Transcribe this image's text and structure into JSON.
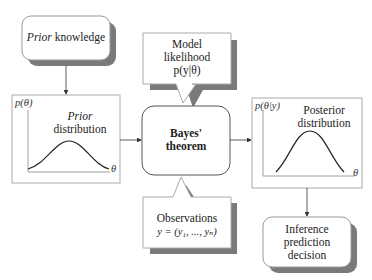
{
  "prior_knowledge": {
    "italic": "Prior",
    "rest": " knowledge"
  },
  "prior_distribution": {
    "title_italic": "Prior",
    "title_rest": "distribution",
    "y_label": "p(θ)",
    "x_label": "θ"
  },
  "model_likelihood": {
    "line1": "Model",
    "line2": "likelihood",
    "line3": "p(y|θ)"
  },
  "bayes": {
    "line1": "Bayes'",
    "line2": "theorem"
  },
  "observations": {
    "line1": "Observations",
    "line2": "y = (y₁, ..., yₙ)"
  },
  "posterior": {
    "title_line1": "Posterior",
    "title_line2": "distribution",
    "y_label": "p(θ|y)",
    "x_label": "θ"
  },
  "inference": {
    "line1": "Inference",
    "line2": "prediction",
    "line3": "decision"
  },
  "colors": {
    "shadow": "#7a7a7a",
    "border": "#999999",
    "line": "#333333"
  }
}
